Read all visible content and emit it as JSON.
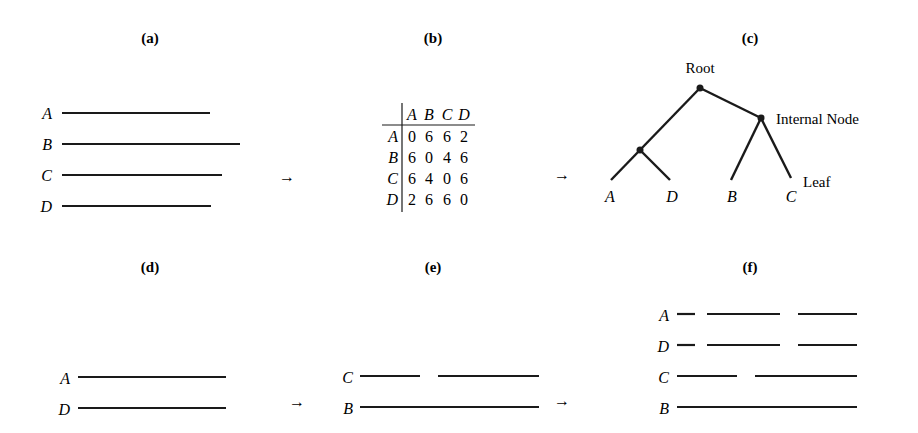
{
  "panels": {
    "a": {
      "label": "(a)"
    },
    "b": {
      "label": "(b)"
    },
    "c": {
      "label": "(c)"
    },
    "d": {
      "label": "(d)"
    },
    "e": {
      "label": "(e)"
    },
    "f": {
      "label": "(f)"
    }
  },
  "arrow": "→",
  "panel_a": {
    "sequences": [
      {
        "name": "A",
        "x1": 62,
        "x2": 210,
        "y": 113
      },
      {
        "name": "B",
        "x1": 62,
        "x2": 240,
        "y": 144
      },
      {
        "name": "C",
        "x1": 62,
        "x2": 222,
        "y": 175
      },
      {
        "name": "D",
        "x1": 62,
        "x2": 211,
        "y": 206
      }
    ]
  },
  "panel_b": {
    "headers": [
      "A",
      "B",
      "C",
      "D"
    ],
    "rows": [
      {
        "name": "A",
        "values": [
          "0",
          "6",
          "6",
          "2"
        ]
      },
      {
        "name": "B",
        "values": [
          "6",
          "0",
          "4",
          "6"
        ]
      },
      {
        "name": "C",
        "values": [
          "6",
          "4",
          "0",
          "6"
        ]
      },
      {
        "name": "D",
        "values": [
          "2",
          "6",
          "6",
          "0"
        ]
      }
    ]
  },
  "panel_c": {
    "root_label": "Root",
    "internal_label": "Internal Node",
    "leaf_label": "Leaf",
    "leaves": [
      "A",
      "D",
      "B",
      "C"
    ]
  },
  "panel_d": {
    "sequences": [
      {
        "name": "A",
        "segments": [
          [
            78,
            226
          ]
        ],
        "y": 377
      },
      {
        "name": "D",
        "segments": [
          [
            78,
            226
          ]
        ],
        "y": 408
      }
    ]
  },
  "panel_e": {
    "sequences": [
      {
        "name": "C",
        "segments": [
          [
            360,
            420
          ],
          [
            438,
            539
          ]
        ],
        "y": 376
      },
      {
        "name": "B",
        "segments": [
          [
            360,
            539
          ]
        ],
        "y": 407
      }
    ]
  },
  "panel_f": {
    "sequences": [
      {
        "name": "A",
        "segments": [
          [
            677,
            695
          ],
          [
            707,
            780
          ],
          [
            798,
            857
          ]
        ],
        "y": 314
      },
      {
        "name": "D",
        "segments": [
          [
            677,
            695
          ],
          [
            707,
            780
          ],
          [
            798,
            857
          ]
        ],
        "y": 345
      },
      {
        "name": "C",
        "segments": [
          [
            677,
            737
          ],
          [
            755,
            857
          ]
        ],
        "y": 376
      },
      {
        "name": "B",
        "segments": [
          [
            677,
            857
          ]
        ],
        "y": 407
      }
    ]
  }
}
